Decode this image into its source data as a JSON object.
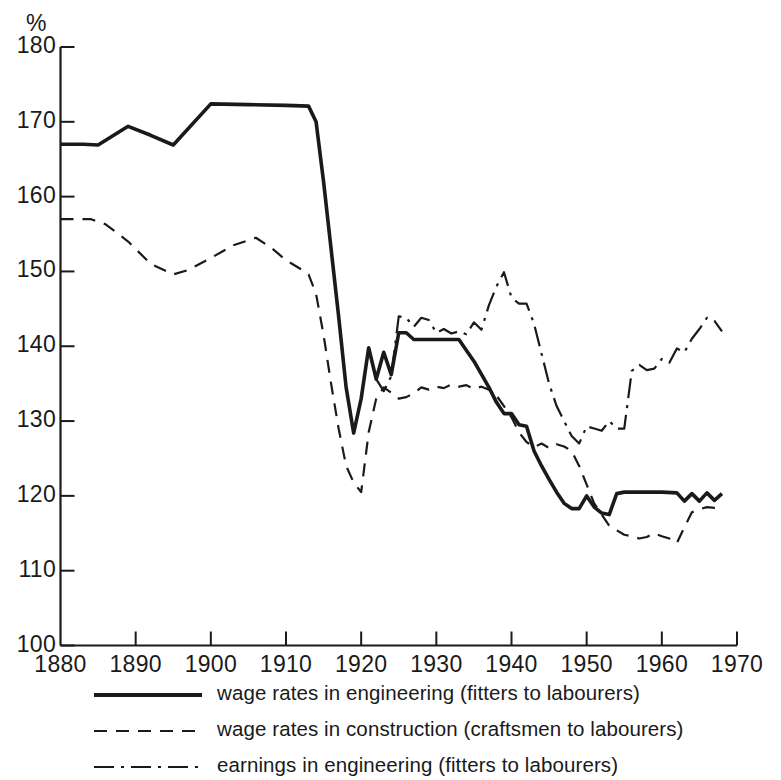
{
  "axes": {
    "unit_label": "%",
    "y_ticks": [
      100,
      110,
      120,
      130,
      140,
      150,
      160,
      170,
      180
    ],
    "x_ticks": [
      1880,
      1890,
      1900,
      1910,
      1920,
      1930,
      1940,
      1950,
      1960,
      1970
    ],
    "y_min": 100,
    "y_max": 180,
    "x_min": 1880,
    "x_max": 1970
  },
  "legend": {
    "items": [
      {
        "label": "wage rates in engineering (fitters to labourers)",
        "style": "solid",
        "icon": "solid-line-icon"
      },
      {
        "label": "wage rates in construction (craftsmen to labourers)",
        "style": "dashed",
        "icon": "dashed-line-icon"
      },
      {
        "label": "earnings in engineering (fitters to labourers)",
        "style": "dashdot",
        "icon": "dash-dot-line-icon"
      }
    ]
  },
  "chart_data": {
    "type": "line",
    "title": "",
    "subtitle": "",
    "xlabel": "",
    "ylabel": "%",
    "xlim": [
      1880,
      1970
    ],
    "ylim": [
      100,
      180
    ],
    "grid": false,
    "legend_position": "below-axes",
    "line_color": "#1a1a1a",
    "series": [
      {
        "name": "wage rates in engineering (fitters to labourers)",
        "style": "solid",
        "points": [
          [
            1880,
            167.0
          ],
          [
            1883,
            167.0
          ],
          [
            1885,
            166.9
          ],
          [
            1889,
            169.4
          ],
          [
            1892,
            168.2
          ],
          [
            1895,
            166.9
          ],
          [
            1900,
            172.4
          ],
          [
            1905,
            172.3
          ],
          [
            1910,
            172.2
          ],
          [
            1913,
            172.1
          ],
          [
            1914,
            170.0
          ],
          [
            1915,
            162.0
          ],
          [
            1916,
            153.0
          ],
          [
            1917,
            144.0
          ],
          [
            1918,
            134.5
          ],
          [
            1919,
            128.4
          ],
          [
            1920,
            133.0
          ],
          [
            1921,
            139.8
          ],
          [
            1922,
            135.6
          ],
          [
            1923,
            139.2
          ],
          [
            1924,
            136.2
          ],
          [
            1925,
            141.8
          ],
          [
            1926,
            141.8
          ],
          [
            1927,
            140.9
          ],
          [
            1928,
            140.9
          ],
          [
            1930,
            140.9
          ],
          [
            1933,
            140.9
          ],
          [
            1935,
            138.0
          ],
          [
            1937,
            134.5
          ],
          [
            1938,
            132.5
          ],
          [
            1939,
            131.0
          ],
          [
            1940,
            131.0
          ],
          [
            1941,
            129.5
          ],
          [
            1942,
            129.3
          ],
          [
            1943,
            126.0
          ],
          [
            1944,
            124.0
          ],
          [
            1945,
            122.2
          ],
          [
            1946,
            120.5
          ],
          [
            1947,
            119.0
          ],
          [
            1948,
            118.3
          ],
          [
            1949,
            118.3
          ],
          [
            1950,
            120.0
          ],
          [
            1951,
            118.5
          ],
          [
            1952,
            117.7
          ],
          [
            1953,
            117.5
          ],
          [
            1954,
            120.3
          ],
          [
            1955,
            120.5
          ],
          [
            1958,
            120.5
          ],
          [
            1960,
            120.5
          ],
          [
            1962,
            120.4
          ],
          [
            1963,
            119.3
          ],
          [
            1964,
            120.3
          ],
          [
            1965,
            119.3
          ],
          [
            1966,
            120.4
          ],
          [
            1967,
            119.4
          ],
          [
            1968,
            120.3
          ]
        ]
      },
      {
        "name": "wage rates in construction (craftsmen to labourers)",
        "style": "dashed",
        "points": [
          [
            1880,
            157.0
          ],
          [
            1884,
            157.0
          ],
          [
            1886,
            156.3
          ],
          [
            1889,
            154.0
          ],
          [
            1892,
            151.0
          ],
          [
            1895,
            149.6
          ],
          [
            1897,
            150.2
          ],
          [
            1900,
            151.8
          ],
          [
            1903,
            153.5
          ],
          [
            1906,
            154.5
          ],
          [
            1908,
            153.2
          ],
          [
            1910,
            151.5
          ],
          [
            1912,
            150.3
          ],
          [
            1913,
            149.6
          ],
          [
            1914,
            147.0
          ],
          [
            1915,
            141.5
          ],
          [
            1916,
            135.0
          ],
          [
            1917,
            129.0
          ],
          [
            1918,
            124.0
          ],
          [
            1919,
            121.8
          ],
          [
            1920,
            120.5
          ],
          [
            1921,
            128.5
          ],
          [
            1922,
            133.0
          ],
          [
            1923,
            134.5
          ],
          [
            1924,
            133.8
          ],
          [
            1925,
            133.0
          ],
          [
            1926,
            133.2
          ],
          [
            1927,
            133.7
          ],
          [
            1928,
            134.5
          ],
          [
            1929,
            134.2
          ],
          [
            1930,
            134.6
          ],
          [
            1931,
            134.4
          ],
          [
            1932,
            134.9
          ],
          [
            1933,
            134.6
          ],
          [
            1934,
            134.8
          ],
          [
            1935,
            134.3
          ],
          [
            1936,
            134.6
          ],
          [
            1937,
            134.2
          ],
          [
            1938,
            133.4
          ],
          [
            1939,
            132.0
          ],
          [
            1940,
            130.5
          ],
          [
            1941,
            128.5
          ],
          [
            1942,
            127.2
          ],
          [
            1943,
            126.5
          ],
          [
            1944,
            127.0
          ],
          [
            1945,
            126.4
          ],
          [
            1946,
            126.9
          ],
          [
            1947,
            126.6
          ],
          [
            1948,
            126.0
          ],
          [
            1949,
            124.0
          ],
          [
            1950,
            121.5
          ],
          [
            1951,
            119.0
          ],
          [
            1952,
            117.5
          ],
          [
            1953,
            116.0
          ],
          [
            1954,
            115.4
          ],
          [
            1955,
            114.8
          ],
          [
            1956,
            114.6
          ],
          [
            1957,
            114.3
          ],
          [
            1958,
            114.5
          ],
          [
            1959,
            115.0
          ],
          [
            1960,
            114.6
          ],
          [
            1961,
            114.3
          ],
          [
            1962,
            113.7
          ],
          [
            1963,
            115.8
          ],
          [
            1964,
            117.8
          ],
          [
            1965,
            118.2
          ],
          [
            1966,
            118.5
          ],
          [
            1967,
            118.4
          ],
          [
            1968,
            118.6
          ]
        ]
      },
      {
        "name": "earnings in engineering (fitters to labourers)",
        "style": "dashdot",
        "points": [
          [
            1922,
            135.6
          ],
          [
            1923,
            134.0
          ],
          [
            1924,
            136.0
          ],
          [
            1925,
            144.0
          ],
          [
            1926,
            143.8
          ],
          [
            1927,
            142.6
          ],
          [
            1928,
            143.8
          ],
          [
            1929,
            143.5
          ],
          [
            1930,
            141.8
          ],
          [
            1931,
            142.3
          ],
          [
            1932,
            141.7
          ],
          [
            1933,
            142.0
          ],
          [
            1934,
            141.6
          ],
          [
            1935,
            143.2
          ],
          [
            1936,
            142.2
          ],
          [
            1937,
            145.5
          ],
          [
            1938,
            148.0
          ],
          [
            1939,
            149.9
          ],
          [
            1940,
            146.5
          ],
          [
            1941,
            145.7
          ],
          [
            1942,
            145.7
          ],
          [
            1943,
            143.0
          ],
          [
            1944,
            139.0
          ],
          [
            1945,
            135.0
          ],
          [
            1946,
            132.0
          ],
          [
            1947,
            130.0
          ],
          [
            1948,
            128.0
          ],
          [
            1949,
            127.0
          ],
          [
            1950,
            129.3
          ],
          [
            1951,
            129.0
          ],
          [
            1952,
            128.7
          ],
          [
            1953,
            130.0
          ],
          [
            1954,
            129.0
          ],
          [
            1955,
            129.0
          ],
          [
            1956,
            136.7
          ],
          [
            1957,
            137.5
          ],
          [
            1958,
            136.8
          ],
          [
            1959,
            137.0
          ],
          [
            1960,
            138.3
          ],
          [
            1961,
            137.8
          ],
          [
            1962,
            139.7
          ],
          [
            1963,
            139.2
          ],
          [
            1964,
            141.0
          ],
          [
            1965,
            142.3
          ],
          [
            1966,
            143.8
          ],
          [
            1967,
            143.4
          ],
          [
            1968,
            142.0
          ]
        ]
      }
    ]
  }
}
